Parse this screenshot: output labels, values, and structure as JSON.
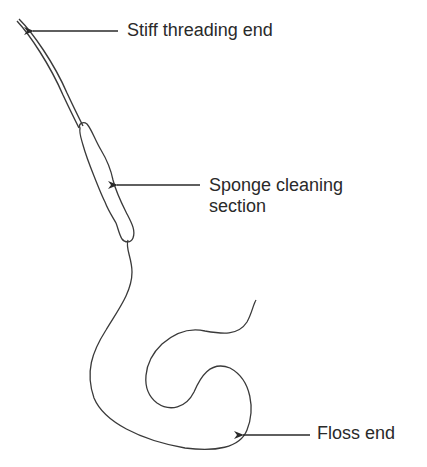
{
  "diagram": {
    "labels": {
      "stiff_threading_end": "Stiff threading end",
      "sponge_line1": "Sponge cleaning",
      "sponge_line2": "section",
      "floss_end": "Floss end"
    },
    "colors": {
      "line": "#3a3a3a",
      "text": "#2a2a2a",
      "background": "#ffffff"
    }
  }
}
